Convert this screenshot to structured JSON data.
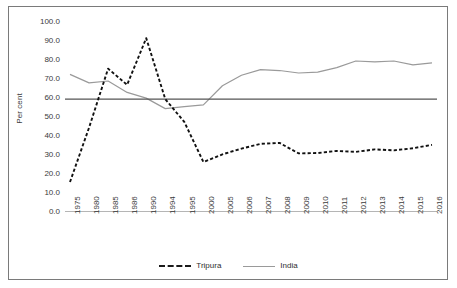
{
  "chart_data": {
    "type": "line",
    "title": "",
    "subtitle": "",
    "xlabel": "",
    "ylabel": "Per cent",
    "ylim": [
      0.0,
      100.0
    ],
    "yticks": [
      "0.0",
      "10.0",
      "20.0",
      "30.0",
      "40.0",
      "50.0",
      "60.0",
      "70.0",
      "80.0",
      "90.0",
      "100.0"
    ],
    "ytick_values": [
      0,
      10,
      20,
      30,
      40,
      50,
      60,
      70,
      80,
      90,
      100
    ],
    "grid": false,
    "legend_position": "bottom",
    "categories": [
      "1975",
      "1980",
      "1985",
      "1986",
      "1990",
      "1994",
      "1995",
      "2000",
      "2005",
      "2006",
      "2007",
      "2008",
      "2009",
      "2010",
      "2011",
      "2012",
      "2013",
      "2014",
      "2015",
      "2016"
    ],
    "series": [
      {
        "name": "Tripura",
        "style": "dashed",
        "color": "#111111",
        "values": [
          15.5,
          44.0,
          75.0,
          66.5,
          91.0,
          59.0,
          47.0,
          26.0,
          30.0,
          33.0,
          35.5,
          36.0,
          30.5,
          30.7,
          31.8,
          31.3,
          32.6,
          32.1,
          33.2,
          35.0
        ]
      },
      {
        "name": "India",
        "style": "solid",
        "color": "#9a9a9a",
        "values": [
          72.0,
          67.5,
          68.5,
          62.5,
          59.5,
          54.0,
          55.0,
          56.0,
          66.0,
          71.5,
          74.5,
          74.0,
          72.7,
          73.2,
          75.5,
          79.0,
          78.5,
          79.0,
          77.0,
          78.0
        ]
      }
    ],
    "reference_line": {
      "name": "reference-line",
      "value": 59.0,
      "color": "#555555",
      "style": "solid"
    }
  },
  "legend": {
    "items": [
      {
        "label": "Tripura",
        "style": "dashed"
      },
      {
        "label": "India",
        "style": "solid"
      }
    ]
  }
}
